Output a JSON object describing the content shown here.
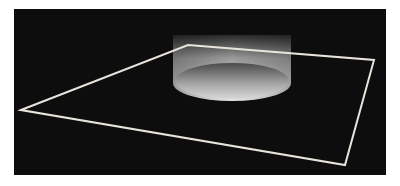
{
  "scene": {
    "background_color": "#0d0d0d",
    "page_color": "#ffffff",
    "plane": {
      "stroke_color": "#e8e4dc",
      "vertices": [
        [
          7,
          101
        ],
        [
          174,
          36
        ],
        [
          360,
          51
        ],
        [
          331,
          156
        ]
      ]
    },
    "cylinder": {
      "center_x": 218,
      "top_y": 26,
      "bottom_cy": 74,
      "rx": 59,
      "ry": 18
    }
  }
}
